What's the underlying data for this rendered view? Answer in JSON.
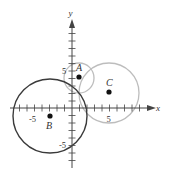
{
  "diagram": {
    "type": "coordinate-plane-circles",
    "axes": {
      "x_label": "x",
      "y_label": "y",
      "x_tick_labels": [
        "-5",
        "5"
      ],
      "y_tick_labels": [
        "5",
        "-5"
      ],
      "x_range": [
        -9,
        9
      ],
      "y_range": [
        -7,
        10
      ]
    },
    "points": [
      {
        "label": "A",
        "x": 1,
        "y": 4
      },
      {
        "label": "B",
        "x": -3,
        "y": -1
      },
      {
        "label": "C",
        "x": 5,
        "y": 2
      }
    ],
    "circles": [
      {
        "center": "A",
        "radius": 2,
        "color": "#bbbbbb"
      },
      {
        "center": "B",
        "radius": 5,
        "color": "#333333"
      },
      {
        "center": "C",
        "radius": 4,
        "color": "#bbbbbb"
      }
    ],
    "colors": {
      "axis": "#444444",
      "dark_circle": "#333333",
      "light_circle": "#bbbbbb",
      "point": "#111111"
    }
  }
}
